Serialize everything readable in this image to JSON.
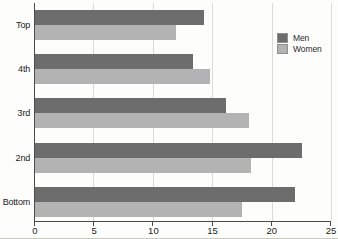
{
  "chart_data": {
    "type": "bar",
    "orientation": "horizontal",
    "title": "",
    "xlabel": "",
    "ylabel": "",
    "categories": [
      "Top",
      "4th",
      "3rd",
      "2nd",
      "Bottom"
    ],
    "series": [
      {
        "name": "Men",
        "color": "#6d6d6d",
        "values": [
          14.2,
          13.3,
          16.1,
          22.5,
          21.9
        ]
      },
      {
        "name": "Women",
        "color": "#b3b3b3",
        "values": [
          11.9,
          14.7,
          18.0,
          18.2,
          17.4
        ]
      }
    ],
    "xlim": [
      0,
      25
    ],
    "xticks": [
      "0",
      "5",
      "10",
      "15",
      "20",
      "25"
    ],
    "xtick_values": [
      0,
      5,
      10,
      15,
      20,
      25
    ],
    "grid": true,
    "gridline_color": "#dbdbd6",
    "axis_color": "#4a4a4a",
    "legend_position": "upper-right",
    "legend": [
      "Men",
      "Women"
    ]
  }
}
